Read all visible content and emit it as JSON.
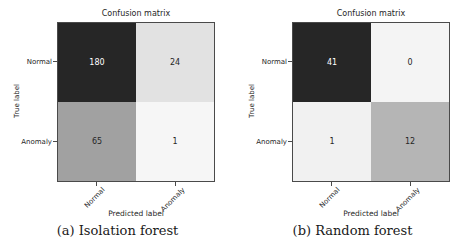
{
  "figure": {
    "background": "#ffffff",
    "text_color": "#262626"
  },
  "chart_data": [
    {
      "type": "heatmap",
      "title": "Confusion matrix",
      "caption": "(a) Isolation forest",
      "xlabel": "Predicted label",
      "ylabel": "True label",
      "x_ticks": [
        "Normal",
        "Anomaly"
      ],
      "y_ticks": [
        "Normal",
        "Anomaly"
      ],
      "values": [
        [
          180,
          24
        ],
        [
          65,
          1
        ]
      ],
      "colormap": "Greys",
      "legend": "none",
      "cell_colors": [
        [
          "#262626",
          "#e2e2e2"
        ],
        [
          "#a1a1a1",
          "#f6f6f6"
        ]
      ],
      "value_colors": [
        [
          "#ffffff",
          "#262626"
        ],
        [
          "#262626",
          "#262626"
        ]
      ]
    },
    {
      "type": "heatmap",
      "title": "Confusion matrix",
      "caption": "(b) Random forest",
      "xlabel": "Predicted label",
      "ylabel": "True label",
      "x_ticks": [
        "Normal",
        "Anomaly"
      ],
      "y_ticks": [
        "Normal",
        "Anomaly"
      ],
      "values": [
        [
          41,
          0
        ],
        [
          1,
          12
        ]
      ],
      "colormap": "Greys",
      "legend": "none",
      "cell_colors": [
        [
          "#262626",
          "#f4f4f4"
        ],
        [
          "#f1f1f1",
          "#b5b5b5"
        ]
      ],
      "value_colors": [
        [
          "#ffffff",
          "#262626"
        ],
        [
          "#262626",
          "#262626"
        ]
      ]
    }
  ]
}
